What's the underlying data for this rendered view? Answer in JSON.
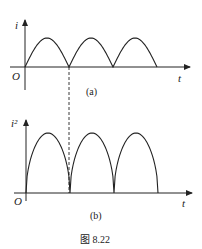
{
  "figure": {
    "caption": "图 8.22",
    "panels": [
      {
        "id": "a",
        "label": "(a)",
        "y_axis_label": "i",
        "x_axis_label": "t",
        "origin_label": "O",
        "curve": "full-wave rectified sine |sin|",
        "humps": 3
      },
      {
        "id": "b",
        "label": "(b)",
        "y_axis_label": "i²",
        "x_axis_label": "t",
        "origin_label": "O",
        "curve": "squared full-wave rectified sine",
        "humps": 3
      }
    ],
    "connector": "dashed vertical line aligning first zero of (a) with first zero of (b)"
  },
  "colors": {
    "stroke": "#222222",
    "background": "#ffffff"
  }
}
